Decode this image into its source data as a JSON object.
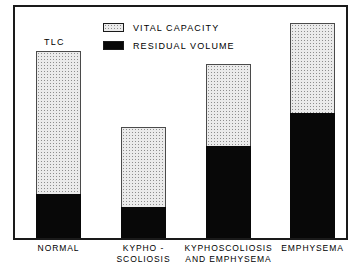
{
  "chart_data": {
    "type": "bar",
    "title": "",
    "subtitle": "",
    "xlabel": "",
    "ylabel": "",
    "stacked": true,
    "grid": false,
    "legend_position": "top-center",
    "ylim": [
      0,
      200
    ],
    "categories": [
      "NORMAL",
      "KYPHO - SCOLIOSIS",
      "KYPHOSCOLIOSIS AND EMPHYSEMA",
      "EMPHYSEMA"
    ],
    "series": [
      {
        "name": "RESIDUAL VOLUME",
        "fill": "solid-black",
        "color": "#080808",
        "values": [
          38,
          27,
          80,
          108
        ]
      },
      {
        "name": "VITAL CAPACITY",
        "fill": "stipple-gray",
        "color": "#ebebeb",
        "values": [
          124,
          69,
          71,
          78
        ]
      }
    ],
    "totals_label": "TLC",
    "totals": [
      162,
      96,
      151,
      186
    ],
    "annotations": [
      {
        "text": "TLC",
        "target_category": "NORMAL",
        "position": "above-bar"
      }
    ]
  },
  "legend": {
    "items": [
      {
        "label": "VITAL CAPACITY",
        "swatch": "stipple-swatch"
      },
      {
        "label": "RESIDUAL VOLUME",
        "swatch": "solid-black-swatch"
      }
    ]
  },
  "annotation": {
    "tlc": "TLC"
  },
  "axis": {
    "categories": [
      {
        "line1": "NORMAL",
        "line2": ""
      },
      {
        "line1": "KYPHO -",
        "line2": "SCOLIOSIS"
      },
      {
        "line1": "KYPHOSCOLIOSIS",
        "line2": "AND EMPHYSEMA"
      },
      {
        "line1": "EMPHYSEMA",
        "line2": ""
      }
    ]
  },
  "colors": {
    "frame": "#1a1a1a",
    "residual_volume": "#080808",
    "vital_capacity": "#ebebeb",
    "background": "#ffffff"
  }
}
